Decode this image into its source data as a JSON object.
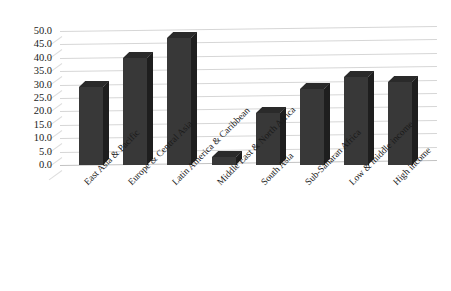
{
  "chart_data": {
    "type": "bar",
    "title": "",
    "subtitle": "",
    "xlabel": "",
    "ylabel": "",
    "ylim": [
      0,
      50
    ],
    "ytick_step": 5,
    "grid": true,
    "legend": false,
    "style": "3d-column",
    "bar_color": "#383838",
    "gridline_color": "#d6d6d6",
    "categories": [
      "East Asia & Pacific",
      "Europe & Central Asia",
      "Latin America & Caribbean",
      "Middle East & North Africa",
      "South Asia",
      "Sub-Saharan Africa",
      "Low & middle income",
      "High income"
    ],
    "values": [
      29.0,
      40.0,
      47.5,
      3.0,
      19.5,
      28.5,
      33.0,
      31.0
    ],
    "ytick_labels": [
      "50.0",
      "45.0",
      "40.0",
      "35.0",
      "30.0",
      "25.0",
      "20.0",
      "15.0",
      "10.0",
      "5.0",
      "0.0"
    ]
  }
}
